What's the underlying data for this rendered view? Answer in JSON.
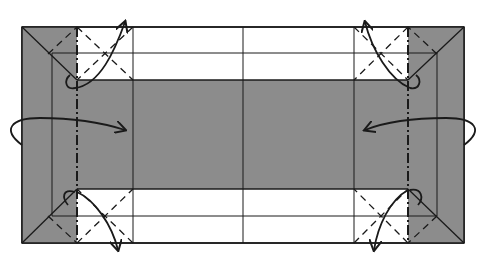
{
  "diagram": {
    "type": "origami-fold-diagram",
    "colors": {
      "paper_white": "#ffffff",
      "paper_gray": "#8c8c8c",
      "line": "#1a1a1a"
    },
    "geometry": {
      "outer": {
        "x1": 22,
        "y1": 27,
        "x2": 464,
        "y2": 243
      },
      "left_strip_right": 77,
      "left_inner_line": 52,
      "right_strip_left": 408,
      "right_inner_line": 437,
      "band_top": 80,
      "band_bottom": 189,
      "top_mid_line": 53,
      "bottom_mid_line": 216,
      "verticals": [
        133,
        243,
        354
      ]
    },
    "arrows": [
      {
        "name": "left-flip-arrow",
        "direction": "fold-in-from-left"
      },
      {
        "name": "right-flip-arrow",
        "direction": "fold-in-from-right"
      },
      {
        "name": "top-left-corner-arrow",
        "direction": "fold-up"
      },
      {
        "name": "top-right-corner-arrow",
        "direction": "fold-up"
      },
      {
        "name": "bottom-left-corner-arrow",
        "direction": "fold-down"
      },
      {
        "name": "bottom-right-corner-arrow",
        "direction": "fold-down"
      }
    ]
  }
}
